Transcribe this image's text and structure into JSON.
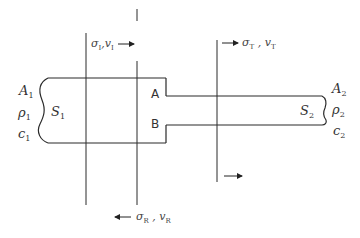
{
  "diagram": {
    "type": "stepped bar wave reflection/transmission schematic",
    "rod1": {
      "area": "A",
      "area_sub": "1",
      "density": "ρ",
      "density_sub": "1",
      "wave_speed": "c",
      "wave_speed_sub": "1",
      "section": "S",
      "section_sub": "1"
    },
    "rod2": {
      "area": "A",
      "area_sub": "2",
      "density": "ρ",
      "density_sub": "2",
      "wave_speed": "c",
      "wave_speed_sub": "2",
      "section": "S",
      "section_sub": "2"
    },
    "interface_points": {
      "top": "A",
      "bottom": "B"
    },
    "waves": {
      "incident": {
        "stress": "σ",
        "stress_sub": "I",
        "velocity": "v",
        "velocity_sub": "I",
        "sep": ",",
        "direction": "right"
      },
      "transmitted": {
        "stress": "σ",
        "stress_sub": "T",
        "velocity": "v",
        "velocity_sub": "T",
        "sep": " ,",
        "direction": "right"
      },
      "reflected": {
        "stress": "σ",
        "stress_sub": "R",
        "velocity": "v",
        "velocity_sub": "R",
        "sep": " ,",
        "direction": "left"
      }
    },
    "colors": {
      "line": "#2a2a2a",
      "text": "#333333",
      "background": "#ffffff"
    }
  }
}
